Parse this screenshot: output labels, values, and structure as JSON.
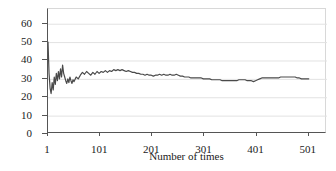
{
  "chart_data": {
    "type": "line",
    "title": "",
    "subtitle": "",
    "xlabel": "Number of times",
    "ylabel": "Percentage of success",
    "xlim": [
      1,
      536
    ],
    "ylim": [
      0,
      68
    ],
    "grid": "horizontal",
    "legend": "none",
    "line_color": "#4a4a4a",
    "grid_color": "#e2e2e2",
    "axis_color": "#555555",
    "xticks": [
      1,
      101,
      201,
      301,
      401,
      501
    ],
    "xtick_labels": [
      "1",
      "101",
      "201",
      "301",
      "401",
      "501"
    ],
    "yticks": [
      0,
      10,
      20,
      30,
      40,
      50,
      60
    ],
    "ytick_labels": [
      "0",
      "10",
      "20",
      "30",
      "40",
      "50",
      "60"
    ],
    "annotations": [],
    "x": [
      1,
      3,
      5,
      7,
      9,
      11,
      13,
      15,
      17,
      19,
      21,
      23,
      25,
      27,
      29,
      31,
      33,
      35,
      37,
      39,
      41,
      43,
      45,
      47,
      49,
      51,
      55,
      59,
      63,
      67,
      71,
      75,
      79,
      83,
      87,
      91,
      95,
      99,
      103,
      107,
      111,
      115,
      119,
      123,
      127,
      131,
      135,
      139,
      143,
      147,
      151,
      155,
      159,
      163,
      167,
      171,
      175,
      179,
      183,
      187,
      191,
      195,
      199,
      203,
      207,
      211,
      215,
      219,
      223,
      227,
      231,
      235,
      239,
      243,
      247,
      251,
      255,
      259,
      263,
      267,
      271,
      275,
      279,
      283,
      287,
      291,
      295,
      299,
      303,
      307,
      311,
      315,
      319,
      323,
      327,
      331,
      335,
      339,
      343,
      347,
      351,
      355,
      359,
      363,
      367,
      371,
      375,
      379,
      383,
      387,
      391,
      395,
      399,
      403,
      407,
      411,
      415,
      419,
      423,
      427,
      431,
      435,
      439,
      443,
      447,
      451,
      455,
      459,
      463,
      467,
      471,
      475,
      479,
      483,
      487,
      491,
      495,
      499,
      501
    ],
    "y": [
      50.0,
      33.0,
      25.0,
      22.0,
      28.0,
      24.0,
      31.0,
      27.0,
      33.0,
      29.0,
      34.0,
      30.0,
      35.5,
      31.0,
      37.5,
      33.0,
      31.0,
      29.0,
      27.5,
      30.0,
      28.0,
      31.0,
      29.0,
      27.5,
      29.5,
      28.5,
      31.0,
      30.0,
      32.0,
      33.5,
      32.5,
      34.0,
      33.0,
      32.0,
      33.5,
      32.5,
      34.0,
      33.0,
      34.0,
      33.5,
      34.5,
      33.5,
      34.5,
      34.0,
      35.0,
      34.5,
      35.0,
      34.5,
      35.0,
      34.5,
      34.0,
      34.5,
      34.0,
      33.5,
      33.5,
      33.0,
      33.0,
      32.5,
      32.5,
      32.0,
      32.5,
      32.0,
      32.0,
      31.5,
      32.0,
      32.0,
      32.5,
      32.0,
      32.5,
      32.0,
      32.0,
      32.5,
      32.0,
      32.0,
      32.5,
      32.0,
      31.5,
      31.5,
      31.0,
      31.0,
      31.0,
      30.5,
      30.5,
      30.5,
      30.5,
      30.5,
      30.5,
      30.0,
      30.0,
      30.0,
      30.0,
      29.5,
      29.5,
      29.5,
      29.5,
      29.5,
      29.0,
      29.0,
      29.0,
      29.0,
      29.0,
      29.0,
      29.0,
      29.0,
      29.5,
      29.5,
      29.5,
      29.5,
      29.0,
      29.0,
      29.0,
      28.5,
      29.0,
      29.5,
      30.0,
      30.5,
      30.5,
      30.5,
      30.5,
      30.5,
      30.5,
      30.5,
      30.5,
      30.5,
      31.0,
      31.0,
      31.0,
      31.0,
      31.0,
      31.0,
      31.0,
      31.0,
      30.5,
      30.5,
      30.0,
      30.0,
      30.0,
      30.0,
      30.0
    ]
  }
}
